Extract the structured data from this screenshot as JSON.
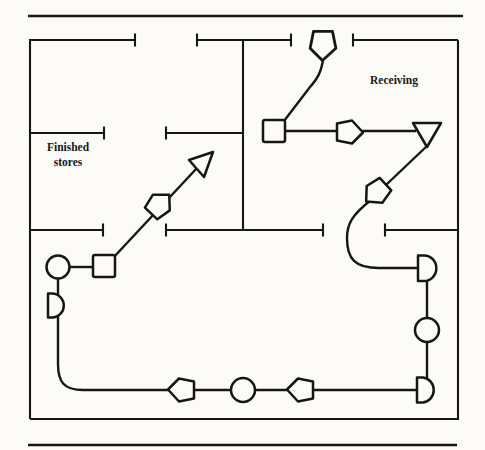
{
  "figure": {
    "type": "flow-diagram",
    "labels": {
      "receiving": "Receiving",
      "finished_stores_line1": "Finished",
      "finished_stores_line2": "stores"
    },
    "colors": {
      "ink": "#161616",
      "paper": "#fcfbf7"
    },
    "rooms": [
      "Finished stores",
      "Receiving"
    ],
    "symbols": [
      {
        "id": "transport-entry",
        "type": "transport-arrow",
        "direction": "down",
        "location": "top wall door gap"
      },
      {
        "id": "inspection-square-1",
        "type": "square",
        "location": "upper middle"
      },
      {
        "id": "transport-right",
        "type": "transport-arrow",
        "direction": "right",
        "location": "upper right"
      },
      {
        "id": "storage-triangle",
        "type": "inverted-triangle",
        "location": "Receiving area"
      },
      {
        "id": "transport-down-left",
        "type": "transport-arrow",
        "direction": "down-left",
        "location": "below storage triangle"
      },
      {
        "id": "delay-d-1",
        "type": "d-shape",
        "location": "right side upper"
      },
      {
        "id": "operation-circle-1",
        "type": "circle",
        "location": "right side middle"
      },
      {
        "id": "delay-d-2",
        "type": "d-shape",
        "location": "right side lower"
      },
      {
        "id": "transport-left-1",
        "type": "transport-arrow",
        "direction": "left",
        "location": "bottom row right"
      },
      {
        "id": "operation-circle-2",
        "type": "circle",
        "location": "bottom row middle"
      },
      {
        "id": "transport-left-2",
        "type": "transport-arrow",
        "direction": "left",
        "location": "bottom row left"
      },
      {
        "id": "delay-d-3",
        "type": "d-shape",
        "location": "left side lower"
      },
      {
        "id": "operation-circle-3",
        "type": "circle",
        "location": "left side"
      },
      {
        "id": "inspection-square-2",
        "type": "square",
        "location": "left of center"
      },
      {
        "id": "transport-up-right",
        "type": "transport-arrow",
        "direction": "up-right",
        "location": "toward finished stores"
      },
      {
        "id": "flow-arrowhead",
        "type": "open-arrowhead",
        "direction": "up-right",
        "location": "entering finished stores"
      }
    ]
  }
}
